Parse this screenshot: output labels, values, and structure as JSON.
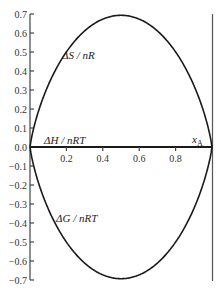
{
  "chart_data": {
    "type": "line",
    "title": "",
    "xlabel": "x_A",
    "ylabel": "",
    "xlim": [
      0,
      1
    ],
    "ylim": [
      -0.7,
      0.7
    ],
    "grid": false,
    "legend": "inline labels",
    "x_ticks": [
      "0.2",
      "0.4",
      "0.6",
      "0.8"
    ],
    "y_ticks": [
      "0.7",
      "0.6",
      "0.5",
      "0.4",
      "0.3",
      "0.2",
      "0.1",
      "0.0",
      "−0.1",
      "−0.2",
      "−0.3",
      "−0.4",
      "−0.5",
      "−0.6",
      "−0.7"
    ],
    "x": [
      0.0,
      0.01,
      0.05,
      0.1,
      0.2,
      0.3,
      0.4,
      0.5,
      0.6,
      0.7,
      0.8,
      0.9,
      0.95,
      0.99,
      1.0
    ],
    "series": [
      {
        "name": "ΔS / nR",
        "label_pos": [
          0.32,
          0.5
        ],
        "values": [
          0.0,
          0.056,
          0.199,
          0.325,
          0.5,
          0.611,
          0.673,
          0.693,
          0.673,
          0.611,
          0.5,
          0.325,
          0.199,
          0.056,
          0.0
        ]
      },
      {
        "name": "ΔH / nRT",
        "label_pos": [
          0.06,
          0.03
        ],
        "values": [
          0,
          0,
          0,
          0,
          0,
          0,
          0,
          0,
          0,
          0,
          0,
          0,
          0,
          0,
          0
        ]
      },
      {
        "name": "ΔG / nRT",
        "label_pos": [
          0.28,
          -0.4
        ],
        "values": [
          0.0,
          -0.056,
          -0.199,
          -0.325,
          -0.5,
          -0.611,
          -0.673,
          -0.693,
          -0.673,
          -0.611,
          -0.5,
          -0.325,
          -0.199,
          -0.056,
          0.0
        ]
      }
    ],
    "annotations": [
      {
        "text": "x_A",
        "pos": [
          0.92,
          0.02
        ]
      }
    ]
  },
  "labels": {
    "dS": "ΔS / nR",
    "dH": "ΔH / nRT",
    "dG": "ΔG / nRT",
    "xA_main": "x",
    "xA_sub": "A"
  }
}
